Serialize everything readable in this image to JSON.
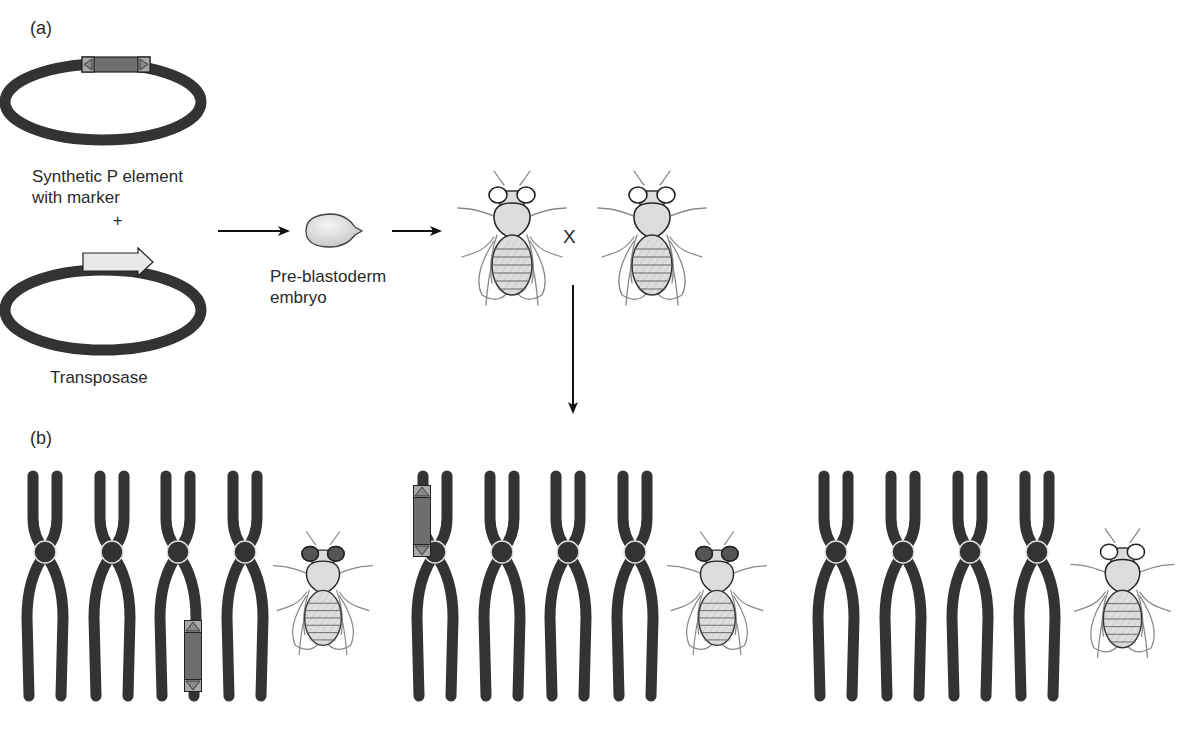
{
  "figure": {
    "panel_a": {
      "label": "(a)",
      "plasmid_p_element_label_line1": "Synthetic P element",
      "plasmid_p_element_label_line2": "with marker",
      "plus": "+",
      "plasmid_transposase_label": "Transposase",
      "embryo_label_line1": "Pre-blastoderm",
      "embryo_label_line2": "embryo",
      "cross_symbol": "X"
    },
    "panel_b": {
      "label": "(b)",
      "groups": [
        {
          "chromosomes": 4,
          "insertion_on_chromosome": 3,
          "insertion_position": "lower-right-arm",
          "fly_eye": "dark"
        },
        {
          "chromosomes": 4,
          "insertion_on_chromosome": 1,
          "insertion_position": "upper-left-arm",
          "fly_eye": "dark"
        },
        {
          "chromosomes": 4,
          "insertion_on_chromosome": null,
          "insertion_position": null,
          "fly_eye": "white"
        }
      ]
    },
    "colors": {
      "chromosome": "#333333",
      "p_element_box": "#6e6e6e",
      "transposase_arrow": "#e8e8e8",
      "fly_body": "#dcdcdc",
      "eye_dark": "#555555",
      "embryo": "#d9d9d9"
    }
  }
}
